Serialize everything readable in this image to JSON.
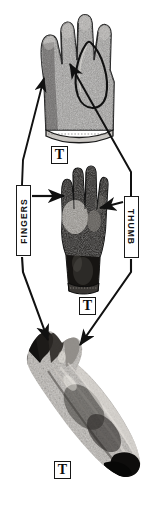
{
  "figure": {
    "background_color": "#ffffff",
    "ink_color": "#111111",
    "panel_count": 3
  },
  "labels": {
    "fingers": {
      "text": "FINGERS",
      "orientation": "rotated-90-ccw",
      "box": true
    },
    "thumb": {
      "text": "THUMB",
      "orientation": "rotated-90-cw",
      "box": true
    },
    "t_marks": [
      {
        "id": "t-top",
        "text": "T",
        "refers_to": "glove"
      },
      {
        "id": "t-mid",
        "text": "T",
        "refers_to": "gloved-hand"
      },
      {
        "id": "t-bot",
        "text": "T",
        "refers_to": "dissected-arm"
      }
    ]
  },
  "specimens": [
    {
      "id": "spec-glove",
      "name": "textured-glove",
      "description": "Speckled gray work glove, palm view, thumb gusset outlined",
      "fill": "#8e8c8a"
    },
    {
      "id": "spec-hand",
      "name": "gloved-hand",
      "description": "Dark rubber glove worn on a hand, palm forward, cuff at wrist",
      "fill": "#2a2724"
    },
    {
      "id": "spec-arm",
      "name": "dissected-arm",
      "description": "Dissected forearm and hand specimen, angled diagonally",
      "fill": "#777472"
    }
  ],
  "connectors": [
    {
      "from": "fingers-label",
      "to": "glove-fingers",
      "arrowhead": true,
      "direction": "up-right"
    },
    {
      "from": "fingers-label",
      "to": "hand-fingers",
      "arrowhead": true,
      "direction": "right"
    },
    {
      "from": "fingers-label",
      "to": "arm-fingers",
      "arrowhead": true,
      "direction": "down-right"
    },
    {
      "from": "thumb-label",
      "to": "glove-thumb",
      "arrowhead": true,
      "direction": "up-left"
    },
    {
      "from": "thumb-label",
      "to": "hand-thumb",
      "arrowhead": true,
      "direction": "left"
    },
    {
      "from": "thumb-label",
      "to": "arm-thumb",
      "arrowhead": true,
      "direction": "down-left"
    }
  ]
}
